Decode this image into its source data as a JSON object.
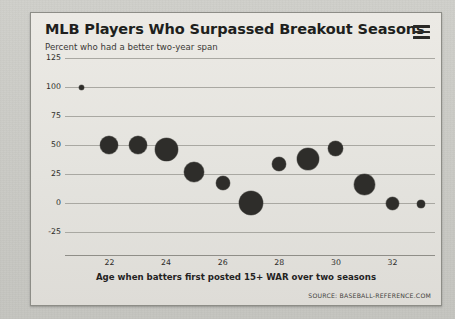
{
  "card": {
    "title": "MLB Players Who Surpassed Breakout Seasons",
    "subtitle": "Percent who had a better two-year span",
    "menu_icon": "hamburger-menu-icon",
    "source": "SOURCE: BASEBALL-REFERENCE.COM"
  },
  "colors": {
    "page_background": "#c9c9c4",
    "card_background": "#e6e6e1",
    "bubble": "#2e2d2a",
    "gridline": "#a9a8a2",
    "text": "#201f1d"
  },
  "chart_data": {
    "type": "scatter",
    "title": "MLB Players Who Surpassed Breakout Seasons",
    "subtitle": "Percent who had a better two-year span",
    "xlabel": "Age when batters first posted 15+ WAR over two seasons",
    "ylabel": "Percent who had a better two-year span",
    "xlim": [
      20.5,
      33.5
    ],
    "ylim": [
      -25,
      125
    ],
    "xticks": [
      22,
      24,
      26,
      28,
      30,
      32
    ],
    "yticks": [
      125,
      100,
      75,
      50,
      25,
      0,
      -25
    ],
    "grid": true,
    "legend": null,
    "size_encodes": "number of players",
    "points": [
      {
        "x": 21,
        "y": 100,
        "size": 5
      },
      {
        "x": 22,
        "y": 50,
        "size": 18
      },
      {
        "x": 23,
        "y": 50,
        "size": 18
      },
      {
        "x": 24,
        "y": 46,
        "size": 23
      },
      {
        "x": 25,
        "y": 27,
        "size": 20
      },
      {
        "x": 26,
        "y": 17,
        "size": 14
      },
      {
        "x": 27,
        "y": 0,
        "size": 24
      },
      {
        "x": 28,
        "y": 34,
        "size": 14
      },
      {
        "x": 29,
        "y": 38,
        "size": 22
      },
      {
        "x": 30,
        "y": 47,
        "size": 15
      },
      {
        "x": 31,
        "y": 16,
        "size": 21
      },
      {
        "x": 32,
        "y": 0,
        "size": 13
      },
      {
        "x": 33,
        "y": -1,
        "size": 8
      }
    ]
  }
}
